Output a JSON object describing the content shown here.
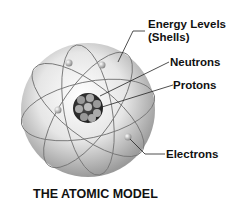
{
  "title": "THE ATOMIC MODEL",
  "labels": {
    "energy_levels_line1": "Energy Levels",
    "energy_levels_line2": "(Shells)",
    "neutrons": "Neutrons",
    "protons": "Protons",
    "electrons": "Electrons"
  },
  "colors": {
    "sphere_light": "#f4f4f4",
    "sphere_dark": "#9a9a9a",
    "nucleus": "#2a2a2a",
    "text": "#111111"
  }
}
